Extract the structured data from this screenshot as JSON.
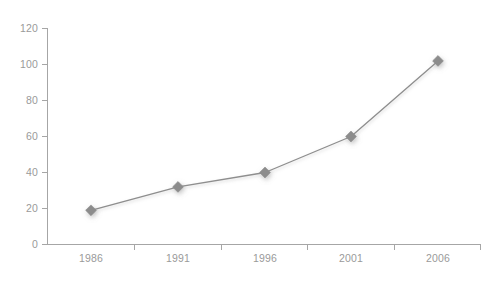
{
  "chart_data": {
    "type": "line",
    "title": "",
    "subtitle": "",
    "xlabel": "",
    "ylabel": "",
    "categories": [
      "1986",
      "1991",
      "1996",
      "2001",
      "2006"
    ],
    "values": [
      19,
      32,
      40,
      60,
      102
    ],
    "series": [
      {
        "name": "series-1",
        "values": [
          19,
          32,
          40,
          60,
          102
        ]
      }
    ],
    "ylim": [
      0,
      120
    ],
    "y_ticks": [
      "0",
      "20",
      "40",
      "60",
      "80",
      "100",
      "120"
    ],
    "y_tick_values": [
      0,
      20,
      40,
      60,
      80,
      100,
      120
    ],
    "x_ticks": [
      "1986",
      "1991",
      "1996",
      "2001",
      "2006"
    ],
    "grid": false,
    "legend": false,
    "legend_position": "none",
    "marker": "diamond",
    "colors": {
      "background": "#ffffff",
      "line": "#8e8e8e",
      "marker": "#8c8c8c",
      "axis": "#a6a6a6",
      "tick_text": "#9a9a9a"
    },
    "annotations": []
  },
  "axes": {
    "y_axis_name": "y-axis",
    "x_axis_name": "x-axis"
  }
}
